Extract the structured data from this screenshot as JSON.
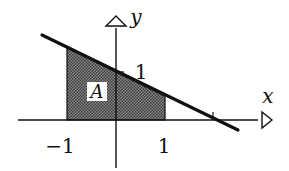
{
  "diagram": {
    "type": "function-graph",
    "axes": {
      "x_label": "x",
      "y_label": "y"
    },
    "ticks": {
      "x_neg_one": "−1",
      "x_one": "1",
      "y_one": "1"
    },
    "line": {
      "equation": "y = 1 - x/2",
      "x_intercept": 2,
      "y_intercept": 1
    },
    "shaded_region": {
      "label": "A",
      "x_from": -1,
      "x_to": 1,
      "description": "area under the line between x = -1 and x = 1"
    },
    "colors": {
      "ink": "#111111",
      "shade": "#6a6a6a",
      "background": "#ffffff"
    }
  }
}
